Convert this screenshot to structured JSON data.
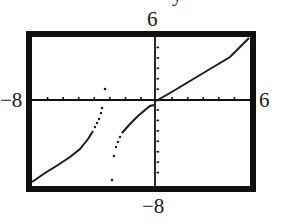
{
  "chart_data": {
    "type": "line",
    "title": "",
    "top_cropped_label": "y",
    "xlabel": "",
    "ylabel": "",
    "xlim": [
      -8,
      6
    ],
    "ylim": [
      -8,
      6
    ],
    "x_tick_step": 1,
    "y_tick_step": 1,
    "grid": false,
    "window_labels": {
      "xmin": "−8",
      "xmax": "6",
      "ymin": "−8",
      "ymax": "6"
    },
    "series": [
      {
        "name": "left branch",
        "style": "connected",
        "points": [
          [
            -8,
            -7.9
          ],
          [
            -6,
            -6.4
          ],
          [
            -4.1,
            -4.9
          ],
          [
            -3.6,
            -3.5
          ],
          [
            -3.3,
            -1.0
          ],
          [
            -3.2,
            1.0
          ]
        ]
      },
      {
        "name": "middle branch",
        "style": "connected",
        "points": [
          [
            -2.7,
            -7.8
          ],
          [
            -2.6,
            -5.3
          ],
          [
            -2.4,
            -4.3
          ],
          [
            -2.0,
            -3.0
          ],
          [
            -1.0,
            -2.1
          ],
          [
            0,
            -0.4
          ]
        ]
      },
      {
        "name": "right branch",
        "style": "connected",
        "points": [
          [
            0,
            0
          ],
          [
            2,
            1.2
          ],
          [
            4,
            2.4
          ],
          [
            5.9,
            6.0
          ]
        ]
      }
    ],
    "vertical_asymptote_approx": -3
  }
}
